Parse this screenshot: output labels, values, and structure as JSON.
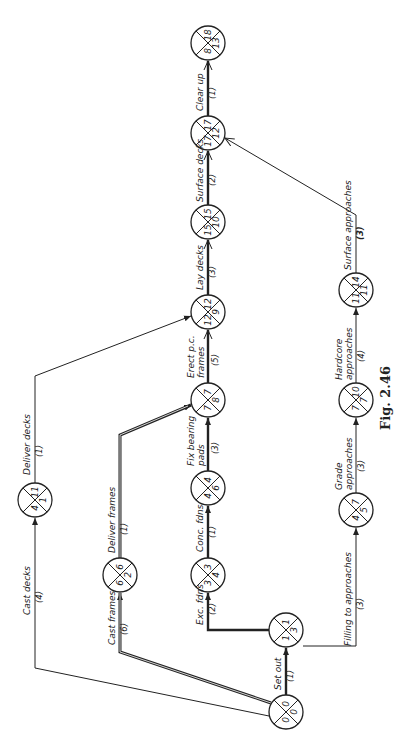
{
  "figure": {
    "caption": "Fig. 2.46"
  },
  "nodes": [
    {
      "id": "n1",
      "cx": 286,
      "cy": 712,
      "top": "0",
      "right": "0",
      "bottom": "0"
    },
    {
      "id": "n2",
      "cx": 286,
      "cy": 630,
      "top": "1",
      "right": "3",
      "bottom": "1"
    },
    {
      "id": "n3",
      "cx": 120,
      "cy": 575,
      "top": "6",
      "right": "2",
      "bottom": "6"
    },
    {
      "id": "n4",
      "cx": 35,
      "cy": 500,
      "top": "11",
      "right": "1",
      "bottom": "4"
    },
    {
      "id": "n5",
      "cx": 208,
      "cy": 575,
      "top": "3",
      "right": "4",
      "bottom": "3"
    },
    {
      "id": "n6",
      "cx": 208,
      "cy": 488,
      "top": "4",
      "right": "6",
      "bottom": "4"
    },
    {
      "id": "n7",
      "cx": 208,
      "cy": 400,
      "top": "7",
      "right": "8",
      "bottom": "7"
    },
    {
      "id": "n8",
      "cx": 208,
      "cy": 312,
      "top": "12",
      "right": "9",
      "bottom": "12"
    },
    {
      "id": "n9",
      "cx": 208,
      "cy": 222,
      "top": "15",
      "right": "10",
      "bottom": "15"
    },
    {
      "id": "n10",
      "cx": 208,
      "cy": 133,
      "top": "17",
      "right": "12",
      "bottom": "17"
    },
    {
      "id": "n11",
      "cx": 208,
      "cy": 43,
      "top": "18",
      "right": "13",
      "bottom": "8"
    },
    {
      "id": "n12",
      "cx": 356,
      "cy": 510,
      "top": "7",
      "right": "5",
      "bottom": "4"
    },
    {
      "id": "n13",
      "cx": 356,
      "cy": 400,
      "top": "10",
      "right": "7",
      "bottom": "7"
    },
    {
      "id": "n14",
      "cx": 356,
      "cy": 290,
      "top": "14",
      "right": "11",
      "bottom": "11"
    }
  ],
  "activities": [
    {
      "id": "set-out",
      "label": "Set out",
      "duration": "(1)",
      "critical": true
    },
    {
      "id": "exc-fdns",
      "label": "Exc. fdns",
      "duration": "(2)",
      "critical": true
    },
    {
      "id": "conc-fdns",
      "label": "Conc. fdns",
      "duration": "(1)",
      "critical": true
    },
    {
      "id": "fix-bearing-pads",
      "label": "Fix bearing pads",
      "duration": "(3)",
      "critical": true
    },
    {
      "id": "erect-pc-frames",
      "label": "Erect p.c. frames",
      "duration": "(5)",
      "critical": true
    },
    {
      "id": "lay-decks",
      "label": "Lay decks",
      "duration": "(3)",
      "critical": true
    },
    {
      "id": "surface-decks",
      "label": "Surface decks",
      "duration": "(2)",
      "critical": true
    },
    {
      "id": "clear-up",
      "label": "Clear up",
      "duration": "(1)",
      "critical": true
    },
    {
      "id": "cast-frames",
      "label": "Cast frames",
      "duration": "(6)",
      "critical": true
    },
    {
      "id": "deliver-frames",
      "label": "Deliver frames",
      "duration": "(1)",
      "critical": true
    },
    {
      "id": "cast-decks",
      "label": "Cast decks",
      "duration": "(4)",
      "critical": false
    },
    {
      "id": "deliver-decks",
      "label": "Deliver decks",
      "duration": "(1)",
      "critical": false
    },
    {
      "id": "filling-to-approaches",
      "label": "Filling to approaches",
      "duration": "(3)",
      "critical": false
    },
    {
      "id": "grade-approaches",
      "label": "Grade approaches",
      "duration": "(3)",
      "critical": false
    },
    {
      "id": "hardcore-approaches",
      "label": "Hardcore approaches",
      "duration": "(4)",
      "critical": false
    },
    {
      "id": "surface-approaches",
      "label": "Surface approaches",
      "duration": "(3)",
      "critical": false
    }
  ],
  "labels": {
    "set_out": "Set out",
    "set_out_d": "(1)",
    "exc_fdns": "Exc. fdns",
    "exc_fdns_d": "(2)",
    "conc_fdns": "Conc. fdns",
    "conc_fdns_d": "(1)",
    "fix_bearing_1": "Fix bearing",
    "fix_bearing_2": "pads",
    "fix_bearing_d": "(3)",
    "erect_1": "Erect p.c.",
    "erect_2": "frames",
    "erect_d": "(5)",
    "lay_decks": "Lay decks",
    "lay_decks_d": "(3)",
    "surface_decks": "Surface decks",
    "surface_decks_d": "(2)",
    "clear_up": "Clear up",
    "clear_up_d": "(1)",
    "cast_frames": "Cast frames",
    "cast_frames_d": "(6)",
    "deliver_frames": "Deliver frames",
    "deliver_frames_d": "(1)",
    "cast_decks": "Cast decks",
    "cast_decks_d": "(4)",
    "deliver_decks": "Deliver decks",
    "deliver_decks_d": "(1)",
    "filling": "Filling to approaches",
    "filling_d": "(3)",
    "grade_1": "Grade",
    "grade_2": "approaches",
    "grade_d": "(3)",
    "hardcore_1": "Hardcore",
    "hardcore_2": "approaches",
    "hardcore_d": "(4)",
    "surface_app": "Surface approaches",
    "surface_app_d": "(3)"
  },
  "colors": {
    "line": "#222222",
    "background": "#ffffff"
  }
}
